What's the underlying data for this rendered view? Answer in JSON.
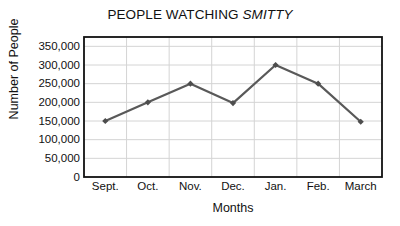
{
  "chart_data": {
    "type": "line",
    "title": "PEOPLE WATCHING SMITTY",
    "title_plain": "PEOPLE WATCHING ",
    "title_italic": "SMITTY",
    "xlabel": "Months",
    "ylabel": "Number of People",
    "categories": [
      "Sept.",
      "Oct.",
      "Nov.",
      "Dec.",
      "Jan.",
      "Feb.",
      "March"
    ],
    "values": [
      150000,
      200000,
      250000,
      198000,
      300000,
      250000,
      148000
    ],
    "series": [
      {
        "name": "People Watching Smitty",
        "values": [
          150000,
          200000,
          250000,
          198000,
          300000,
          250000,
          148000
        ]
      }
    ],
    "ytick_labels": [
      "350,000",
      "300,000",
      "250,000",
      "200,000",
      "150,000",
      "100,000",
      "50,000",
      "0"
    ],
    "ytick_values": [
      350000,
      300000,
      250000,
      200000,
      150000,
      100000,
      50000,
      0
    ],
    "ylim": [
      0,
      375000
    ],
    "xlim": [
      0,
      7
    ],
    "grid": true,
    "legend": false,
    "legend_position": "none",
    "marker": "diamond",
    "colors": {
      "line": "#595959",
      "marker": "#4d4d4d",
      "grid": "#d4d4d4",
      "frame": "#111111",
      "background": "#ffffff",
      "text": "#111111"
    }
  }
}
